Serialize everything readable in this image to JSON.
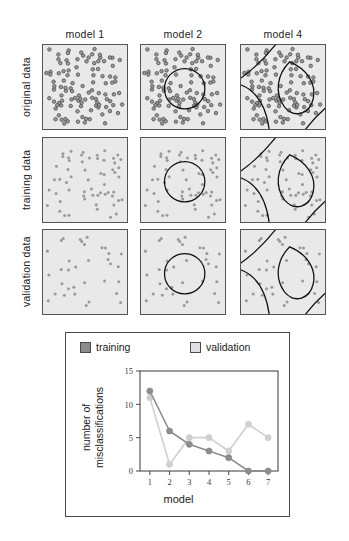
{
  "figure": {
    "columns": [
      "model 1",
      "model 2",
      "model 4"
    ],
    "rows": [
      "original data",
      "training data",
      "validation data"
    ]
  },
  "chart_data": {
    "type": "line",
    "title": "",
    "xlabel": "model",
    "ylabel": "number of misclassifications",
    "categories": [
      "1",
      "2",
      "3",
      "4",
      "5",
      "6",
      "7"
    ],
    "x": [
      1,
      2,
      3,
      4,
      5,
      6,
      7
    ],
    "series": [
      {
        "name": "training",
        "values": [
          12,
          6,
          4,
          3,
          2,
          0,
          0
        ],
        "color": "#8c8c8c"
      },
      {
        "name": "validation",
        "values": [
          11,
          1,
          5,
          5,
          3,
          7,
          5
        ],
        "color": "#cfcfcf"
      }
    ],
    "ylim": [
      0,
      15
    ],
    "yticks": [
      "0",
      "5",
      "10",
      "15"
    ],
    "xlim": [
      0.5,
      7.5
    ],
    "grid": false,
    "legend_position": "top"
  },
  "legend": {
    "training_label": "training",
    "validation_label": "validation",
    "training_color": "#8c8c8c",
    "validation_color": "#e0e0e0"
  },
  "axes": {
    "y_ticks": [
      "15",
      "10",
      "5",
      "0"
    ],
    "x_ticks": [
      "1",
      "2",
      "3",
      "4",
      "5",
      "6",
      "7"
    ],
    "x_title": "model",
    "y_title_line1": "number of",
    "y_title_line2": "misclassifications"
  },
  "colors": {
    "panel_background": "#e9e9e9",
    "panel_border": "#555555",
    "point_fill": "#9a9a9a",
    "point_stroke": "#4a4a4a",
    "boundary": "#111111",
    "chart_border": "#4a4a4a"
  }
}
